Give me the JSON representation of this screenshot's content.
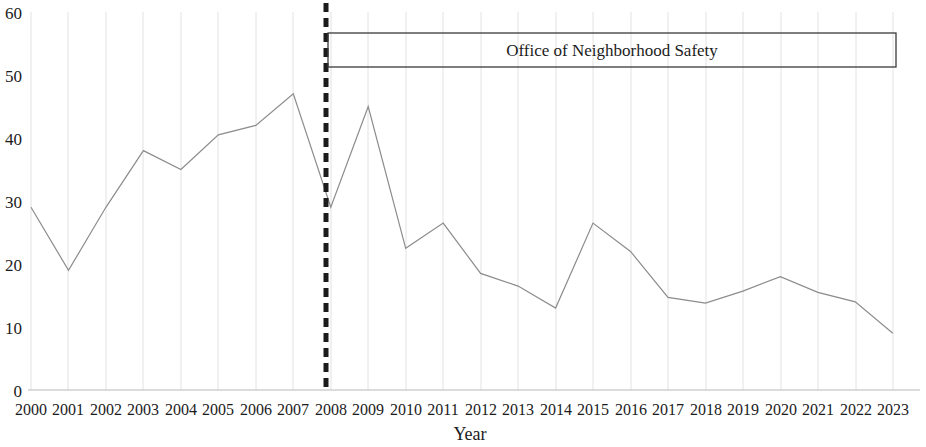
{
  "chart_data": {
    "type": "line",
    "title": "",
    "xlabel": "Year",
    "ylabel": "",
    "categories": [
      "2000",
      "2001",
      "2002",
      "2003",
      "2004",
      "2005",
      "2006",
      "2007",
      "2008",
      "2009",
      "2010",
      "2011",
      "2012",
      "2013",
      "2014",
      "2015",
      "2016",
      "2017",
      "2018",
      "2019",
      "2020",
      "2021",
      "2022",
      "2023"
    ],
    "values": [
      29,
      19,
      29,
      38,
      35,
      40.5,
      42,
      47,
      29,
      45,
      22.5,
      26.5,
      18.5,
      16.5,
      13,
      26.5,
      22,
      14.7,
      13.8,
      15.7,
      18,
      15.5,
      14,
      9
    ],
    "series": [
      {
        "name": "Homicides",
        "values": [
          29,
          19,
          29,
          38,
          35,
          40.5,
          42,
          47,
          29,
          45,
          22.5,
          26.5,
          18.5,
          16.5,
          13,
          26.5,
          22,
          14.7,
          13.8,
          15.7,
          18,
          15.5,
          14,
          9
        ]
      }
    ],
    "ylim": [
      0,
      60
    ],
    "yticks": [
      0,
      10,
      20,
      30,
      40,
      50,
      60
    ],
    "ytick_labels": [
      "0",
      "10",
      "20",
      "30",
      "40",
      "50",
      "60"
    ],
    "grid": "vertical",
    "legend": "none",
    "annotations": [
      {
        "name": "office-of-neighborhood-safety-bracket",
        "label": "Office of Neighborhood Safety",
        "start_year": "2008",
        "end_year": "2023",
        "marker": "dashed-vertical-line-at-2008"
      }
    ],
    "line_color": "#8c8c8c",
    "event_line_color": "#1b1b1b",
    "grid_color": "#e2e2e2"
  },
  "axis": {
    "y_labels": [
      "60",
      "50",
      "40",
      "30",
      "20",
      "10",
      "0"
    ],
    "x_labels": [
      "2000",
      "2001",
      "2002",
      "2003",
      "2004",
      "2005",
      "2006",
      "2007",
      "2008",
      "2009",
      "2010",
      "2011",
      "2012",
      "2013",
      "2014",
      "2015",
      "2016",
      "2017",
      "2018",
      "2019",
      "2020",
      "2021",
      "2022",
      "2023"
    ],
    "x_title": "Year"
  },
  "annotation": {
    "box_label": "Office of Neighborhood Safety"
  }
}
